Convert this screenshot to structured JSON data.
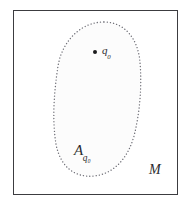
{
  "figure": {
    "title": "",
    "background_color": "#ffffff",
    "frame": {
      "border_color": "#3c3c40",
      "fill_color": "#ffffff"
    },
    "region": {
      "name": "dotted-oval-region",
      "label_base": "A",
      "label_subscript": "q₀",
      "stroke_color": "#6e6e76",
      "fill_color": "#fcfcfc",
      "stroke_style": "dotted"
    },
    "point": {
      "name": "marked-point",
      "label": "q",
      "label_subscript": "0",
      "color": "#1b1b1d"
    },
    "ambient": {
      "name": "ambient-space",
      "label": "M",
      "color": "#2b2b2e"
    }
  }
}
